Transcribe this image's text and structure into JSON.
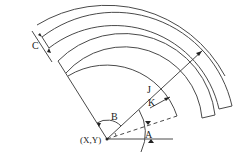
{
  "diagram": {
    "title": "",
    "center_label": "(X,Y)",
    "labels": {
      "A": "A",
      "B": "B",
      "C": "C",
      "J": "J",
      "K": "K"
    },
    "colors": {
      "line": "#4a4a4a",
      "text": "#222222",
      "background": "#ffffff"
    },
    "geometry": {
      "center": [
        107,
        139
      ],
      "bands": [
        {
          "name": "outer-arc",
          "r_inner": 134,
          "r_outer": 134,
          "start_deg": 122,
          "end_deg": 32,
          "closed": false
        },
        {
          "name": "band-2",
          "r_inner": 107,
          "r_outer": 120,
          "start_deg": 122,
          "end_deg": -14,
          "closed": true
        },
        {
          "name": "band-1",
          "r_inner": 78,
          "r_outer": 92,
          "start_deg": 122,
          "end_deg": -13,
          "closed": true
        }
      ],
      "radial_line_deg": 122,
      "jk_line_deg": 40,
      "dashed_line_deg": 18,
      "horizontal_line_length": 46
    }
  }
}
